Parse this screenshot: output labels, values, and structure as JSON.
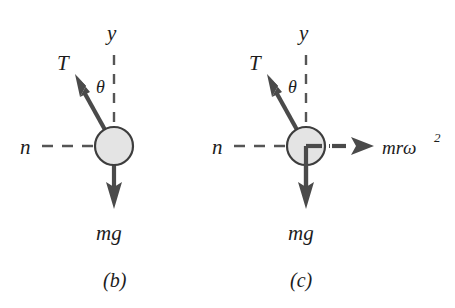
{
  "figure": {
    "background_color": "#ffffff",
    "ink_color": "#1c1c1c",
    "vector_color": "#4a4a4a",
    "dash_color": "#555555",
    "ball_fill_color": "#e4e4e4",
    "ball_stroke_color": "#3d3d3d"
  },
  "panels": [
    {
      "id": "panel-b",
      "caption": "(b)",
      "ball": {
        "cx": 114,
        "cy": 146,
        "r": 19
      },
      "labels": {
        "tension": "T",
        "angle": "θ",
        "vertical_axis": "y",
        "normal": "n",
        "weight": "mg"
      },
      "vectors": [
        {
          "name": "tension-vector",
          "label": "T",
          "from": [
            114,
            146
          ],
          "to": [
            74,
            74
          ],
          "style": "solid"
        },
        {
          "name": "weight-vector",
          "label": "mg",
          "from": [
            114,
            146
          ],
          "to": [
            114,
            208
          ],
          "style": "solid"
        }
      ],
      "dashed_lines": [
        {
          "name": "y-axis-dashed-line",
          "from": [
            114,
            55
          ],
          "to": [
            114,
            126
          ],
          "label": "y"
        },
        {
          "name": "n-axis-dashed-line",
          "from": [
            42,
            146
          ],
          "to": [
            95,
            146
          ],
          "label": "n"
        }
      ]
    },
    {
      "id": "panel-c",
      "caption": "(c)",
      "ball": {
        "cx": 306,
        "cy": 146,
        "r": 19
      },
      "labels": {
        "tension": "T",
        "angle": "θ",
        "vertical_axis": "y",
        "normal": "n",
        "weight": "mg",
        "centrifugal": "mrω",
        "centrifugal_exponent": "2"
      },
      "vectors": [
        {
          "name": "tension-vector",
          "label": "T",
          "from": [
            306,
            146
          ],
          "to": [
            266,
            74
          ],
          "style": "solid"
        },
        {
          "name": "weight-vector",
          "label": "mg",
          "from": [
            306,
            146
          ],
          "to": [
            306,
            208
          ],
          "style": "solid"
        },
        {
          "name": "centrifugal-vector",
          "label": "mrω²",
          "from": [
            306,
            146
          ],
          "to": [
            372,
            146
          ],
          "style": "dashed"
        }
      ],
      "dashed_lines": [
        {
          "name": "y-axis-dashed-line",
          "from": [
            306,
            55
          ],
          "to": [
            306,
            126
          ],
          "label": "y"
        },
        {
          "name": "n-axis-dashed-line",
          "from": [
            234,
            146
          ],
          "to": [
            287,
            146
          ],
          "label": "n"
        }
      ]
    }
  ]
}
